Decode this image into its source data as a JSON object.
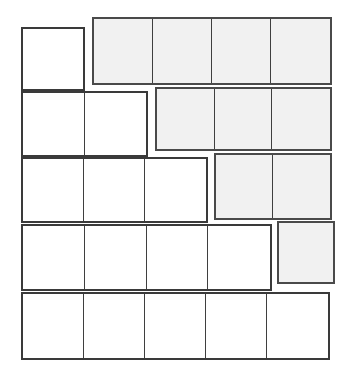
{
  "diagram": {
    "type": "grid-partition-diagram",
    "canvas": {
      "width": 355,
      "height": 375
    },
    "style": {
      "background_color": "#ffffff",
      "stroke_color": "#3a3a3a",
      "plain_fill": "#ffffff",
      "shaded_fill": "#f1f1f1",
      "outer_border_width": 2,
      "inner_divider_width": 1.5
    },
    "rows_count": 5,
    "columns_count": 5,
    "groups": [
      {
        "id": "r1-left",
        "row": 1,
        "label": "row-1-left-group",
        "cells": 1,
        "shaded": false,
        "x": 21,
        "y": 27,
        "width": 64,
        "height": 64
      },
      {
        "id": "r1-right",
        "row": 1,
        "label": "row-1-right-group",
        "cells": 4,
        "shaded": true,
        "x": 92,
        "y": 17,
        "width": 240,
        "height": 68
      },
      {
        "id": "r2-left",
        "row": 2,
        "label": "row-2-left-group",
        "cells": 2,
        "shaded": false,
        "x": 21,
        "y": 91,
        "width": 127,
        "height": 66
      },
      {
        "id": "r2-right",
        "row": 2,
        "label": "row-2-right-group",
        "cells": 3,
        "shaded": true,
        "x": 155,
        "y": 87,
        "width": 177,
        "height": 64
      },
      {
        "id": "r3-left",
        "row": 3,
        "label": "row-3-left-group",
        "cells": 3,
        "shaded": false,
        "x": 21,
        "y": 157,
        "width": 187,
        "height": 66
      },
      {
        "id": "r3-right",
        "row": 3,
        "label": "row-3-right-group",
        "cells": 2,
        "shaded": true,
        "x": 214,
        "y": 153,
        "width": 118,
        "height": 67
      },
      {
        "id": "r4-left",
        "row": 4,
        "label": "row-4-left-group",
        "cells": 4,
        "shaded": false,
        "x": 21,
        "y": 224,
        "width": 251,
        "height": 67
      },
      {
        "id": "r4-right",
        "row": 4,
        "label": "row-4-right-group",
        "cells": 1,
        "shaded": true,
        "x": 277,
        "y": 221,
        "width": 58,
        "height": 63
      },
      {
        "id": "r5-full",
        "row": 5,
        "label": "row-5-full-group",
        "cells": 5,
        "shaded": false,
        "x": 21,
        "y": 292,
        "width": 309,
        "height": 68
      }
    ]
  }
}
